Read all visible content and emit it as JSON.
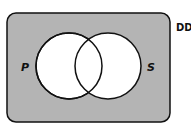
{
  "diagram": {
    "type": "venn",
    "universe_label": "DD",
    "sets": [
      {
        "label": "P",
        "fill": "#ffffff"
      },
      {
        "label": "S",
        "fill": "#ffffff"
      }
    ],
    "shaded_region": "outside both circles",
    "shade_color": "#b4b4b4",
    "stroke_color": "#111111"
  }
}
